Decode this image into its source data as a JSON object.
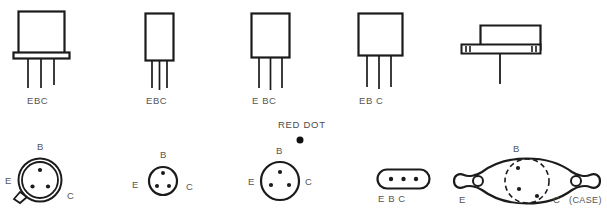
{
  "figure": {
    "note_red_dot": "RED DOT",
    "case_note": "(CASE)"
  },
  "top_row": {
    "items": [
      {
        "id": "pkg-flanged-metal-can",
        "pinout_label": "EBC",
        "lead_count": 3
      },
      {
        "id": "pkg-tall-plastic",
        "pinout_label": "EBC",
        "lead_count": 3
      },
      {
        "id": "pkg-medium-plastic",
        "pinout_label": "E BC",
        "lead_count": 3
      },
      {
        "id": "pkg-wide-plastic",
        "pinout_label": "EB C",
        "lead_count": 3
      },
      {
        "id": "pkg-to3-side-view",
        "pinout_label": "",
        "lead_count": 1
      }
    ]
  },
  "bottom_row": {
    "items": [
      {
        "id": "case-metal-can-with-tab",
        "pins": {
          "top": "B",
          "left": "E",
          "right": "C"
        },
        "pin_count": 3,
        "has_locating_tab": true,
        "has_double_rim": true
      },
      {
        "id": "case-small-metal-can",
        "pins": {
          "top": "B",
          "left": "E",
          "right": "C"
        },
        "pin_count": 3,
        "has_locating_tab": false,
        "has_double_rim": false
      },
      {
        "id": "case-metal-can-red-dot",
        "pins": {
          "top": "B",
          "left": "E",
          "right": "C"
        },
        "pin_count": 3,
        "marker_label": "RED DOT",
        "has_marker_dot": true
      },
      {
        "id": "case-inline-oval",
        "pinout_label": "E B C",
        "pin_count": 3
      },
      {
        "id": "case-to3-bottom-view",
        "pins": {
          "top": "B",
          "left": "E",
          "right": "C"
        },
        "case_label": "(CASE)",
        "pin_count": 2,
        "mounting_holes": 2
      }
    ]
  },
  "colors": {
    "ink": "#1b1b1b",
    "text": "#555555",
    "background": "#ffffff"
  },
  "bottom_cut_text": "the line of text below is cut off"
}
